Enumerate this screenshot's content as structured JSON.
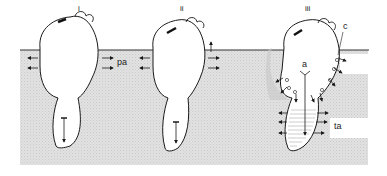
{
  "diagram": {
    "type": "three-stage schematic of a cell/organism embedded in a substrate",
    "colors": {
      "background": "#ffffff",
      "substrate": "#dedede",
      "outline": "#1a1a1a",
      "halo": "#c8c8c8"
    },
    "panels": [
      {
        "id": "i",
        "label": "i",
        "side_label": "pa"
      },
      {
        "id": "ii",
        "label": "ii"
      },
      {
        "id": "iii",
        "label": "iii",
        "labels": [
          "a",
          "c",
          "ta"
        ]
      }
    ]
  }
}
